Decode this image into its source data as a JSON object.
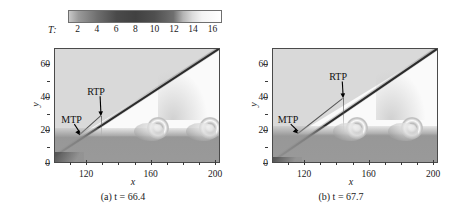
{
  "figure": {
    "type": "two-panel-contour",
    "colorbar": {
      "label": "T:",
      "ticks": [
        2,
        4,
        6,
        8,
        10,
        12,
        14,
        16
      ],
      "range": [
        1,
        17
      ],
      "colormap": "grayscale-inverted",
      "stops": [
        {
          "t": 1,
          "color": "#c8c8c8"
        },
        {
          "t": 2,
          "color": "#9a9a9a"
        },
        {
          "t": 4,
          "color": "#6e6e6e"
        },
        {
          "t": 6,
          "color": "#4a4a4a"
        },
        {
          "t": 8,
          "color": "#414141"
        },
        {
          "t": 10,
          "color": "#4f4f4f"
        },
        {
          "t": 12,
          "color": "#6f6f6f"
        },
        {
          "t": 13,
          "color": "#b4b4b4"
        },
        {
          "t": 14,
          "color": "#dcdcdc"
        },
        {
          "t": 15,
          "color": "#f4f4f4"
        },
        {
          "t": 17,
          "color": "#ffffff"
        }
      ]
    },
    "panels": [
      {
        "id": "a",
        "caption_prefix": "(a)",
        "caption_var": "t",
        "caption_eq": "=",
        "caption_value": "66.4",
        "caption_full": "(a) t = 66.4",
        "xlabel": "x",
        "ylabel": "y",
        "xticks": [
          120,
          160,
          200
        ],
        "yticks": [
          0,
          20,
          40,
          60
        ],
        "xlim": [
          100,
          203
        ],
        "ylim": [
          0,
          70
        ],
        "annotations": [
          {
            "label": "MTP",
            "label_x": 112,
            "label_y": 27,
            "tip_x": 115.5,
            "tip_y": 17.5
          },
          {
            "label": "RTP",
            "label_x": 128,
            "label_y": 44,
            "tip_x": 128.5,
            "tip_y": 29
          }
        ]
      },
      {
        "id": "b",
        "caption_prefix": "(b)",
        "caption_var": "t",
        "caption_eq": "=",
        "caption_value": "67.7",
        "caption_full": "(b) t = 67.7",
        "xlabel": "x",
        "ylabel": "y",
        "xticks": [
          120,
          160,
          200
        ],
        "yticks": [
          0,
          20,
          40,
          60
        ],
        "xlim": [
          100,
          203
        ],
        "ylim": [
          0,
          70
        ],
        "annotations": [
          {
            "label": "MTP",
            "label_x": 111,
            "label_y": 27,
            "tip_x": 115.5,
            "tip_y": 18.5
          },
          {
            "label": "RTP",
            "label_x": 143,
            "label_y": 53,
            "tip_x": 143.5,
            "tip_y": 40
          }
        ]
      }
    ]
  },
  "chart_data": {
    "type": "heatmap",
    "title": "",
    "xlabel": "x",
    "ylabel": "y",
    "xlim": [
      100,
      203
    ],
    "ylim": [
      0,
      70
    ],
    "colorbar_label": "T",
    "colorbar_ticks": [
      2,
      4,
      6,
      8,
      10,
      12,
      14,
      16
    ],
    "colorbar_range": [
      1,
      17
    ],
    "grid": false,
    "legend": "none",
    "panels": [
      {
        "name": "(a) t = 66.4",
        "time": 66.4,
        "features": {
          "incident_shock": {
            "x0": 100,
            "y0": 5.0,
            "x1": 203,
            "y1": 71.0
          },
          "mach_triple_point": {
            "x": 115.5,
            "y": 17.5,
            "abbrev": "MTP"
          },
          "reflected_triple_point": {
            "x": 128.5,
            "y": 29.0,
            "abbrev": "RTP"
          },
          "shear_layer_height": 17.0,
          "vortices_x": [
            164,
            196
          ],
          "vortex_y": 22,
          "boundary_layer_top": 14
        }
      },
      {
        "name": "(b) t = 67.7",
        "time": 67.7,
        "features": {
          "incident_shock": {
            "x0": 100,
            "y0": 2.0,
            "x1": 203,
            "y1": 71.0
          },
          "mach_triple_point": {
            "x": 115.5,
            "y": 18.5,
            "abbrev": "MTP"
          },
          "reflected_triple_point": {
            "x": 143.5,
            "y": 40.0,
            "abbrev": "RTP"
          },
          "shear_layer_height": 18.0,
          "vortices_x": [
            152,
            186
          ],
          "vortex_y": 22,
          "boundary_layer_top": 14
        }
      }
    ]
  }
}
